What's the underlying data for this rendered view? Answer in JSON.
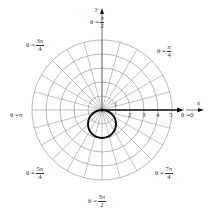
{
  "figure": {
    "type": "polar-graph",
    "curve": "r = -2 sin(theta)",
    "grid": {
      "rings": [
        1,
        2,
        3,
        4,
        5
      ],
      "ray_step_deg": 15
    },
    "colors": {
      "grid": "#9a9a9a",
      "curve": "#111111",
      "axis": "#111111",
      "text": "#333333"
    }
  },
  "axes": {
    "x_label": "x",
    "y_label": "y"
  },
  "ticks": [
    "1",
    "2",
    "3",
    "4",
    "5"
  ],
  "angle_labels": {
    "zero": {
      "prefix": "θ = ",
      "value": "0"
    },
    "pi": {
      "prefix": "θ = ",
      "value": "π"
    },
    "pi_over_2": {
      "prefix": "θ = ",
      "num": "π",
      "den": "2"
    },
    "pi_over_4": {
      "prefix": "θ = ",
      "num": "π",
      "den": "4"
    },
    "three_pi_over_4": {
      "prefix": "θ = ",
      "num": "3π",
      "den": "4"
    },
    "five_pi_over_4": {
      "prefix": "θ = ",
      "num": "5π",
      "den": "4"
    },
    "three_pi_over_2": {
      "prefix": "θ = ",
      "num": "3π",
      "den": "2"
    },
    "seven_pi_over_4": {
      "prefix": "θ = ",
      "num": "7π",
      "den": "4"
    }
  }
}
